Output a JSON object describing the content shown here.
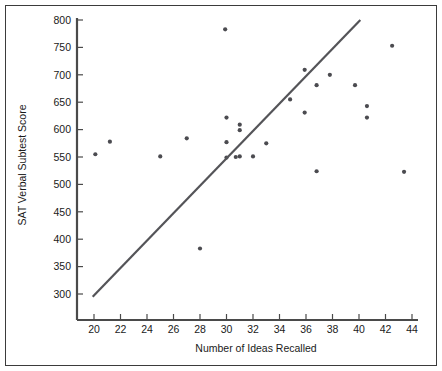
{
  "chart_data": {
    "type": "scatter",
    "title": "",
    "xlabel": "Number of Ideas Recalled",
    "ylabel": "SAT Verbal Subtest Score",
    "xlim": [
      18.8,
      45.0
    ],
    "ylim": [
      282,
      800
    ],
    "xticks": [
      20,
      22,
      24,
      26,
      28,
      30,
      32,
      34,
      36,
      38,
      40,
      42,
      44
    ],
    "yticks": [
      300,
      350,
      400,
      450,
      500,
      550,
      600,
      650,
      700,
      750,
      800
    ],
    "xtick_labels": [
      "20",
      "22",
      "24",
      "26",
      "28",
      "30",
      "32",
      "34",
      "36",
      "38",
      "40",
      "42",
      "44"
    ],
    "ytick_labels": [
      "300",
      "350",
      "400",
      "450",
      "500",
      "550",
      "600",
      "650",
      "700",
      "750",
      "800"
    ],
    "grid": false,
    "legend": null,
    "marker_color": "#4b4b50",
    "line_color": "#545458",
    "axis_color": "#4a4a4a",
    "frame_color": "#3b3b3b",
    "points": [
      {
        "x": 20.1,
        "y": 555
      },
      {
        "x": 21.2,
        "y": 578
      },
      {
        "x": 25.0,
        "y": 551
      },
      {
        "x": 27.0,
        "y": 584
      },
      {
        "x": 28.0,
        "y": 383
      },
      {
        "x": 29.9,
        "y": 783
      },
      {
        "x": 30.0,
        "y": 622
      },
      {
        "x": 30.0,
        "y": 577
      },
      {
        "x": 30.0,
        "y": 549
      },
      {
        "x": 31.0,
        "y": 609
      },
      {
        "x": 31.0,
        "y": 599
      },
      {
        "x": 31.0,
        "y": 551
      },
      {
        "x": 30.7,
        "y": 550
      },
      {
        "x": 32.0,
        "y": 551
      },
      {
        "x": 33.0,
        "y": 575
      },
      {
        "x": 34.8,
        "y": 655
      },
      {
        "x": 35.9,
        "y": 709
      },
      {
        "x": 35.9,
        "y": 631
      },
      {
        "x": 36.8,
        "y": 681
      },
      {
        "x": 36.8,
        "y": 524
      },
      {
        "x": 37.8,
        "y": 700
      },
      {
        "x": 39.7,
        "y": 681
      },
      {
        "x": 40.6,
        "y": 643
      },
      {
        "x": 40.6,
        "y": 622
      },
      {
        "x": 42.5,
        "y": 753
      },
      {
        "x": 43.4,
        "y": 523
      }
    ],
    "trend_line": {
      "label": "regression-line",
      "x_start": 19.9,
      "y_start": 295,
      "x_end": 40.1,
      "y_end": 800
    }
  }
}
